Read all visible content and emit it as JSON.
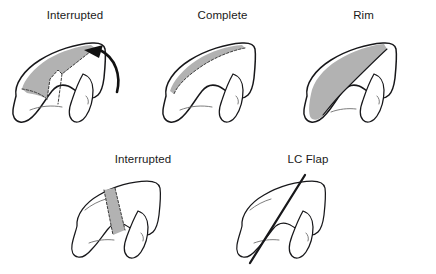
{
  "figure": {
    "background_color": "#ffffff",
    "ink_color": "#17171a",
    "shade_color": "#b2b2b2",
    "panels": [
      {
        "id": "top-left",
        "label": "Interrupted",
        "label_x": 85,
        "label_y": 18,
        "shading": "wedge-with-notch",
        "has_arrow": true,
        "arrow_direction": "counterclockwise-up-left",
        "dashed_margin": true
      },
      {
        "id": "top-middle",
        "label": "Complete",
        "label_x": 235,
        "label_y": 18,
        "shading": "thin-upper-band",
        "has_arrow": false,
        "dashed_margin": true
      },
      {
        "id": "top-right",
        "label": "Rim",
        "label_x": 364,
        "label_y": 18,
        "shading": "large-left-lobe",
        "has_arrow": false,
        "dashed_margin": false
      },
      {
        "id": "bottom-left",
        "label": "Interrupted",
        "label_x": 150,
        "label_y": 162,
        "shading": "vertical-band",
        "has_arrow": false,
        "dashed_margin": true
      },
      {
        "id": "bottom-right",
        "label": "LC Flap",
        "label_x": 305,
        "label_y": 162,
        "shading": "none",
        "has_arrow": false,
        "flap_line": true
      }
    ]
  }
}
